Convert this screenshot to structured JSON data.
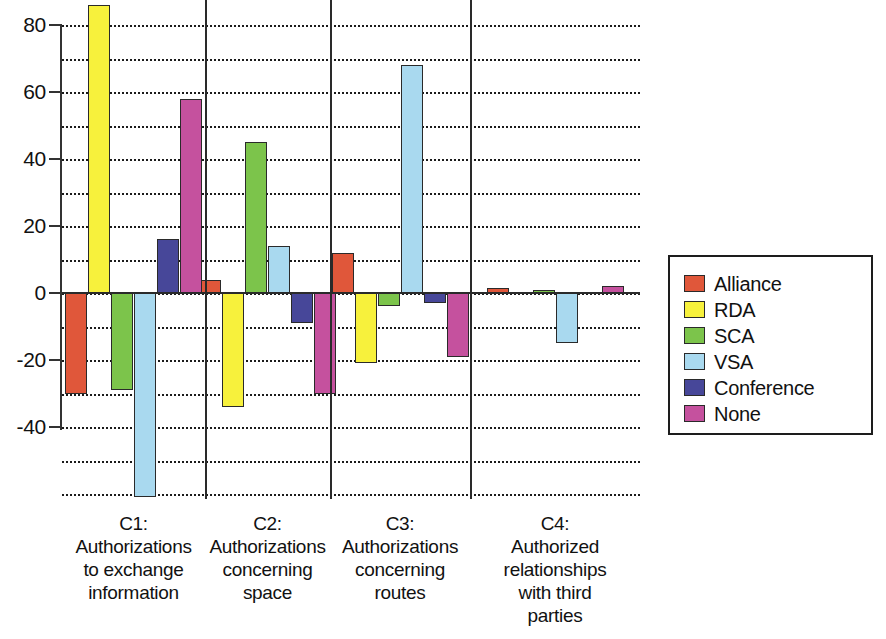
{
  "chart_data": {
    "type": "bar",
    "title": "",
    "subtitle": "",
    "xlabel": "",
    "ylabel": "",
    "ylim": [
      -70,
      90
    ],
    "y_ticks": [
      80,
      60,
      40,
      20,
      0,
      -20,
      -40
    ],
    "y_tick_labels": [
      "80",
      "60",
      "40",
      "20",
      "0",
      "-20",
      "-40"
    ],
    "gridlines": [
      80,
      70,
      60,
      50,
      40,
      30,
      20,
      10,
      0,
      -10,
      -20,
      -30,
      -40,
      -50,
      -60
    ],
    "grid": true,
    "grid_style": "dotted",
    "legend_position": "right",
    "orientation": "vertical",
    "grouped": true,
    "categories": [
      "C1:\nAuthorizations\nto exchange\ninformation",
      "C2:\nAuthorizations\nconcerning\nspace",
      "C3:\nAuthorizations\nconcerning\nroutes",
      "C4:\nAuthorized\nrelationships\nwith third\nparties"
    ],
    "category_lines": [
      [
        "C1:",
        "Authorizations",
        "to exchange",
        "information"
      ],
      [
        "C2:",
        "Authorizations",
        "concerning",
        "space"
      ],
      [
        "C3:",
        "Authorizations",
        "concerning",
        "routes"
      ],
      [
        "C4:",
        "Authorized",
        "relationships",
        "with third",
        "parties"
      ]
    ],
    "series": [
      {
        "name": "Alliance",
        "color": "#E0573A",
        "values": [
          -30,
          4,
          12,
          1.5
        ]
      },
      {
        "name": "RDA",
        "color": "#F7F13C",
        "values": [
          86,
          -34,
          -21,
          0
        ]
      },
      {
        "name": "SCA",
        "color": "#7CC44B",
        "values": [
          -29,
          45,
          -4,
          1
        ]
      },
      {
        "name": "VSA",
        "color": "#A9D9EF",
        "values": [
          -61,
          14,
          68,
          -15
        ]
      },
      {
        "name": "Conference",
        "color": "#474799",
        "values": [
          16,
          -9,
          -3,
          0
        ]
      },
      {
        "name": "None",
        "color": "#C5519E",
        "values": [
          58,
          -30,
          -19,
          2
        ]
      }
    ]
  },
  "legend": {
    "entries": [
      {
        "label": "Alliance",
        "color": "#E0573A"
      },
      {
        "label": "RDA",
        "color": "#F7F13C"
      },
      {
        "label": "SCA",
        "color": "#7CC44B"
      },
      {
        "label": "VSA",
        "color": "#A9D9EF"
      },
      {
        "label": "Conference",
        "color": "#474799"
      },
      {
        "label": "None",
        "color": "#C5519E"
      }
    ]
  }
}
